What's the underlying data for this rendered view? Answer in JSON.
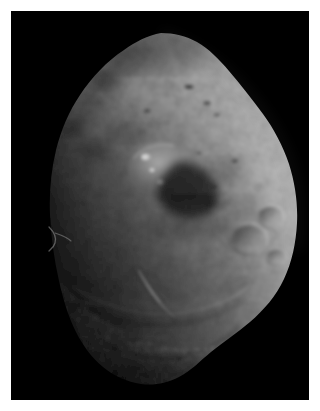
{
  "image": {
    "kind": "space-probe-grayscale-photograph",
    "subject": "comet-nucleus",
    "caption": "",
    "width_px": 320,
    "height_px": 411,
    "border": {
      "color": "#ffffff",
      "thickness_px": 11
    },
    "plate": {
      "background_color": "#000000",
      "x_px": 11,
      "y_px": 11,
      "width_px": 298,
      "height_px": 389
    },
    "palette": {
      "space_black": "#000000",
      "terminator_shadow": "#0a0a0a",
      "dark_terrain": "#2e2e2e",
      "mid_terrain": "#5c5c5c",
      "light_terrain": "#7e7e7e",
      "bright_limb": "#a6a6a6",
      "specular_highlight": "#e8e8e8",
      "matte_white": "#ffffff"
    },
    "illumination": {
      "sun_direction": "upper-right",
      "terminator_edge": "left",
      "limb_brightening_edge": "right"
    }
  },
  "nucleus": {
    "label": "comet nucleus",
    "outline_points": "150,22 183,26 205,46 228,72 249,96 268,126 281,163 286,203 283,240 272,272 252,297 226,318 202,337 186,356 168,368 141,374 112,369 90,356 74,336 62,311 53,281 45,247 40,210 42,172 51,134 66,100 88,68 113,44",
    "bounding_box": {
      "x_px": 40,
      "y_px": 22,
      "width_px": 246,
      "height_px": 352
    }
  },
  "features": [
    {
      "name": "summit-ridge",
      "type": "ridge",
      "description": "upper apex ridge running down-right from the top vertex",
      "brightness": "mid"
    },
    {
      "name": "bright-mesa",
      "type": "mesa",
      "description": "elevated smooth plateau near the center with two specular highlights",
      "center_px": [
        150,
        160
      ],
      "brightness": "high"
    },
    {
      "name": "specular-spot-upper",
      "type": "highlight",
      "center_px": [
        146,
        157
      ],
      "radius_px": 5,
      "brightness": "specular"
    },
    {
      "name": "specular-spot-lower",
      "type": "highlight",
      "center_px": [
        152,
        170
      ],
      "radius_px": 3,
      "brightness": "specular"
    },
    {
      "name": "mesa-shadow",
      "type": "shadow",
      "description": "dark cast shadow along the lower-right flank of the mesa",
      "brightness": "very-low"
    },
    {
      "name": "crater-right-upper",
      "type": "crater",
      "center_px": [
        250,
        238
      ],
      "radius_px": 17,
      "brightness": "mid"
    },
    {
      "name": "crater-right-lower",
      "type": "crater",
      "center_px": [
        271,
        216
      ],
      "radius_px": 12,
      "brightness": "mid"
    },
    {
      "name": "crater-basin-central",
      "type": "crater",
      "center_px": [
        173,
        323
      ],
      "radius_px": 13,
      "brightness": "mid"
    },
    {
      "name": "scarp-diagonal",
      "type": "scarp",
      "description": "bright linear scarp running from upper-left to lower-right across the mid-lower body",
      "from_px": [
        141,
        265
      ],
      "to_px": [
        163,
        300
      ],
      "brightness": "high"
    },
    {
      "name": "layered-terrace",
      "type": "terrace",
      "description": "arcuate layered terrace boundary sweeping across the lower third",
      "brightness": "mid"
    },
    {
      "name": "pitted-lowlands",
      "type": "terrain",
      "description": "heavily pitted rough terrain occupying the bottom of the nucleus",
      "brightness": "low-mid"
    },
    {
      "name": "limb-streak-left",
      "type": "streak",
      "description": "faint thin bright filament just off the dark left limb",
      "center_px": [
        55,
        232
      ],
      "brightness": "low"
    },
    {
      "name": "terminator-left",
      "type": "terminator",
      "description": "shadowed left limb fading into black space",
      "brightness": "very-low"
    }
  ],
  "a11y": {
    "alt_text": "Grayscale spacecraft photograph of an irregular comet nucleus on a black background, framed by a white border. Sunlight comes from the upper right, brightening the right limb, while the left edge fades into shadow. The surface shows impact craters, a bright smooth mesa with two specular highlights near the center, a diagonal bright scarp, arcuate layered terraces, and heavily pitted lowlands near the bottom."
  }
}
